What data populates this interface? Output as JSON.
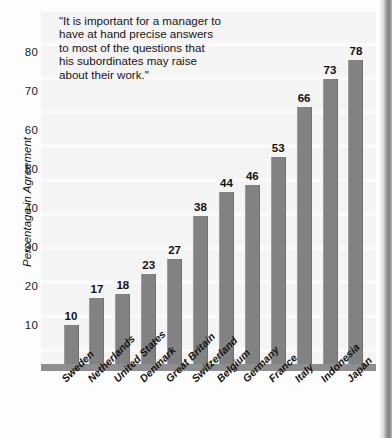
{
  "chart_data": {
    "type": "bar",
    "title": "",
    "subtitle": "",
    "annotation": "\"It is important for a manager to have at hand precise answers to most of the questions that his subordinates may raise about their work.\"",
    "annotation_lines": [
      "\"It is important for a manager to",
      "have at hand precise answers",
      "to most of the questions that",
      "his subordinates may raise",
      "about their work.\""
    ],
    "xlabel": "",
    "ylabel": "Percentage in Agreement",
    "ylim": [
      0,
      88
    ],
    "yticks": [
      10,
      20,
      30,
      40,
      50,
      60,
      70,
      80
    ],
    "grid": false,
    "legend": "none",
    "bar_color": "#828282",
    "plot_background": "#f4f4f4",
    "text_color": "#141414",
    "categories": [
      "Sweden",
      "Netherlands",
      "United States",
      "Denmark",
      "Great Britain",
      "Switzerland",
      "Belgium",
      "Germany",
      "France",
      "Italy",
      "Indonesia",
      "Japan"
    ],
    "values": [
      10,
      17,
      18,
      23,
      27,
      38,
      44,
      46,
      53,
      66,
      73,
      78
    ],
    "value_labels": [
      "10",
      "17",
      "18",
      "23",
      "27",
      "38",
      "44",
      "46",
      "53",
      "66",
      "73",
      "78"
    ]
  }
}
